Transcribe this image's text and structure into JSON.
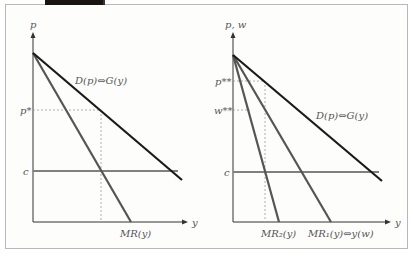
{
  "figure": {
    "left_panel": {
      "y_axis_label": "p",
      "x_axis_label": "y",
      "demand_label": "D(p)⇔G(y)",
      "mr_label": "MR(y)",
      "price_label": "p*",
      "cost_label": "c"
    },
    "right_panel": {
      "y_axis_label": "p, w",
      "x_axis_label": "y",
      "demand_label": "D(p)⇔G(y)",
      "mr1_label": "MR₁(y)⇔y(w)",
      "mr2_label": "MR₂(y)",
      "price_label": "p**",
      "wage_label": "w**",
      "cost_label": "c"
    },
    "colors": {
      "demand": "#1a1a1a",
      "mr": "#555555",
      "cost": "#808080",
      "axis": "#333333",
      "dashed": "#999999",
      "topbar": "#1a1410"
    }
  }
}
